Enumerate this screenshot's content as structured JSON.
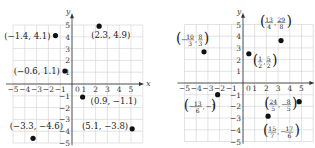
{
  "chart_data": [
    {
      "type": "scatter",
      "title": "",
      "xlabel": "x",
      "ylabel": "y",
      "xlim": [
        -5,
        5
      ],
      "ylim": [
        -5,
        5
      ],
      "grid": true,
      "x_ticks": [
        "-5",
        "-4",
        "-3",
        "-2",
        "-1",
        "0",
        "1",
        "2",
        "3",
        "4",
        "5"
      ],
      "y_ticks": [
        "5",
        "4",
        "3",
        "2",
        "1",
        "-1",
        "-2",
        "-3",
        "-4",
        "-5"
      ],
      "points": [
        {
          "x": -1.4,
          "y": 4.1,
          "label": "(−1.4, 4.1)"
        },
        {
          "x": 2.3,
          "y": 4.9,
          "label": "(2.3, 4.9)"
        },
        {
          "x": -0.6,
          "y": 1.1,
          "label": "(−0.6, 1.1)"
        },
        {
          "x": 0.9,
          "y": -1.1,
          "label": "(0.9, −1.1)"
        },
        {
          "x": -3.3,
          "y": -4.6,
          "label": "(−3.3, −4.6)"
        },
        {
          "x": 5.1,
          "y": -3.8,
          "label": "(5.1, −3.8)"
        }
      ]
    },
    {
      "type": "scatter",
      "title": "",
      "xlabel": "x",
      "ylabel": "y",
      "xlim": [
        -5,
        5
      ],
      "ylim": [
        -5,
        5
      ],
      "grid": true,
      "x_ticks": [
        "-5",
        "-4",
        "-3",
        "-2",
        "-1",
        "0",
        "1",
        "2",
        "3",
        "4",
        "5"
      ],
      "y_ticks": [
        "5",
        "4",
        "3",
        "2",
        "1",
        "-1",
        "-2",
        "-3",
        "-4",
        "-5"
      ],
      "points": [
        {
          "x": -3.333,
          "y": 2.667,
          "label": "(−10/3, 8/3)"
        },
        {
          "x": 0.5,
          "y": 2.5,
          "label": "(1/2, 5/2)"
        },
        {
          "x": 3.25,
          "y": 3.625,
          "label": "(13/4, 29/8)"
        },
        {
          "x": -2.167,
          "y": -1,
          "label": "(−13/6, −1)"
        },
        {
          "x": 4.8,
          "y": -1.6,
          "label": "(24/5, −8/5)"
        },
        {
          "x": 2.143,
          "y": -2.833,
          "label": "(15/7, −17/6)"
        }
      ]
    }
  ],
  "left": {
    "axis_x": "x",
    "axis_y": "y",
    "labels": [
      "(−1.4, 4.1)",
      "(2.3, 4.9)",
      "(−0.6, 1.1)",
      "(0.9, −1.1)",
      "(−3.3, −4.6)",
      "(5.1, −3.8)"
    ]
  },
  "right": {
    "axis_x": "x",
    "axis_y": "y",
    "fractions": [
      {
        "sign": "−",
        "num": "10",
        "den": "3",
        "sign2": "",
        "num2": "8",
        "den2": "3"
      },
      {
        "sign": "",
        "num": "1",
        "den": "2",
        "sign2": "",
        "num2": "5",
        "den2": "2"
      },
      {
        "sign": "",
        "num": "13",
        "den": "4",
        "sign2": "",
        "num2": "29",
        "den2": "8"
      },
      {
        "sign": "−",
        "num": "13",
        "den": "6",
        "sign2": "−1",
        "num2": "",
        "den2": ""
      },
      {
        "sign": "",
        "num": "24",
        "den": "5",
        "sign2": "−",
        "num2": "8",
        "den2": "5"
      },
      {
        "sign": "",
        "num": "15",
        "den": "7",
        "sign2": "−",
        "num2": "17",
        "den2": "6"
      }
    ]
  }
}
